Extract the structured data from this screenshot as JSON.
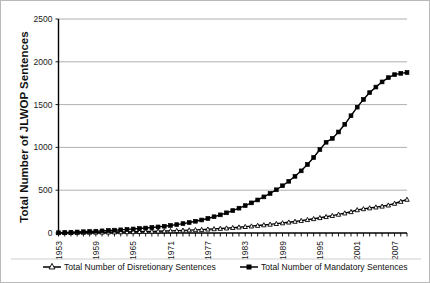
{
  "chart_data": {
    "type": "line",
    "title": "",
    "xlabel": "",
    "ylabel": "Total Number of JLWOP Sentences",
    "ylim": [
      0,
      2500
    ],
    "yticks": [
      0,
      500,
      1000,
      1500,
      2000,
      2500
    ],
    "ytick_labels": [
      "0",
      "500",
      "1000",
      "1500",
      "2000",
      "2500"
    ],
    "grid": true,
    "legend_position": "bottom",
    "xlim": [
      1953,
      2009
    ],
    "xtick_labels": [
      "1953",
      "1959",
      "1965",
      "1971",
      "1977",
      "1983",
      "1989",
      "1995",
      "2001",
      "2007"
    ],
    "xtick_step": 6,
    "x": [
      1953,
      1954,
      1955,
      1956,
      1957,
      1958,
      1959,
      1960,
      1961,
      1962,
      1963,
      1964,
      1965,
      1966,
      1967,
      1968,
      1969,
      1970,
      1971,
      1972,
      1973,
      1974,
      1975,
      1976,
      1977,
      1978,
      1979,
      1980,
      1981,
      1982,
      1983,
      1984,
      1985,
      1986,
      1987,
      1988,
      1989,
      1990,
      1991,
      1992,
      1993,
      1994,
      1995,
      1996,
      1997,
      1998,
      1999,
      2000,
      2001,
      2002,
      2003,
      2004,
      2005,
      2006,
      2007,
      2008,
      2009
    ],
    "series": [
      {
        "name": "Total Number of Disretionary Sentences",
        "marker": "triangle-open",
        "values": [
          2,
          3,
          4,
          5,
          6,
          7,
          8,
          9,
          10,
          11,
          12,
          13,
          14,
          15,
          17,
          19,
          21,
          23,
          25,
          28,
          31,
          34,
          37,
          40,
          44,
          48,
          52,
          57,
          62,
          68,
          74,
          80,
          87,
          94,
          101,
          109,
          117,
          126,
          135,
          145,
          155,
          166,
          178,
          190,
          203,
          217,
          232,
          248,
          270,
          282,
          292,
          302,
          312,
          325,
          345,
          368,
          392
        ]
      },
      {
        "name": "Total Number of Mandatory Sentences",
        "marker": "square-filled",
        "values": [
          3,
          6,
          9,
          12,
          15,
          18,
          21,
          25,
          29,
          33,
          37,
          42,
          47,
          52,
          58,
          64,
          71,
          79,
          88,
          98,
          110,
          123,
          137,
          152,
          170,
          190,
          212,
          236,
          262,
          290,
          320,
          352,
          386,
          422,
          462,
          505,
          552,
          604,
          662,
          726,
          800,
          882,
          975,
          1060,
          1105,
          1180,
          1270,
          1370,
          1470,
          1560,
          1640,
          1705,
          1765,
          1815,
          1850,
          1865,
          1875
        ]
      }
    ]
  },
  "legend": {
    "entries": [
      {
        "label": "Total Number of Disretionary Sentences",
        "marker": "triangle-open-icon"
      },
      {
        "label": "Total Number of Mandatory Sentences",
        "marker": "square-filled-icon"
      }
    ]
  }
}
